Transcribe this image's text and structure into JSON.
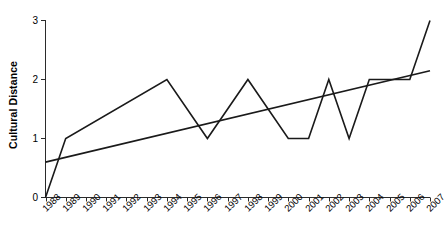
{
  "chart_data": {
    "type": "line",
    "title": "",
    "xlabel": "",
    "ylabel": "Cultural Distance",
    "x": [
      1988,
      1989,
      1990,
      1991,
      1992,
      1993,
      1994,
      1995,
      1996,
      1997,
      1998,
      1999,
      2000,
      2001,
      2002,
      2003,
      2004,
      2005,
      2006,
      2007
    ],
    "categories": [
      "1988",
      "1989",
      "1990",
      "1991",
      "1992",
      "1993",
      "1994",
      "1995",
      "1996",
      "1997",
      "1998",
      "1999",
      "2000",
      "2001",
      "2002",
      "2003",
      "2004",
      "2005",
      "2006",
      "2007"
    ],
    "xlim": [
      1988,
      2007
    ],
    "ylim": [
      0,
      3
    ],
    "yticks": [
      0,
      1,
      2,
      3
    ],
    "ytick_labels": [
      "0",
      "1",
      "2",
      "3"
    ],
    "grid": false,
    "legend": "none",
    "series": [
      {
        "name": "Cultural Distance",
        "type": "line",
        "color": "#1a1a1a",
        "values": [
          0,
          1,
          1.2,
          1.4,
          1.6,
          1.8,
          2,
          1.5,
          1,
          1.5,
          2,
          1.5,
          1,
          1,
          2,
          1,
          2,
          2,
          2,
          3
        ]
      },
      {
        "name": "Linear trend",
        "type": "line",
        "color": "#1a1a1a",
        "x": [
          1988,
          2007
        ],
        "values": [
          0.6,
          2.15
        ]
      }
    ],
    "vertices": [
      {
        "year": "1988",
        "value": 0
      },
      {
        "year": "1989",
        "value": 1
      },
      {
        "year": "1994",
        "value": 2
      },
      {
        "year": "1996",
        "value": 1
      },
      {
        "year": "1998",
        "value": 2
      },
      {
        "year": "2000",
        "value": 1
      },
      {
        "year": "2001",
        "value": 1
      },
      {
        "year": "2002",
        "value": 2
      },
      {
        "year": "2003",
        "value": 1
      },
      {
        "year": "2004",
        "value": 2
      },
      {
        "year": "2006",
        "value": 2
      },
      {
        "year": "2007",
        "value": 3
      }
    ]
  }
}
